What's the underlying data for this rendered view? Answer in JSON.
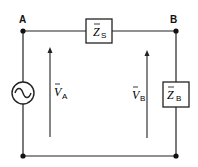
{
  "diagram": {
    "type": "circuit",
    "nodes": [
      {
        "id": "A",
        "label": "A"
      },
      {
        "id": "B",
        "label": "B"
      }
    ],
    "components": {
      "source": {
        "kind": "ac-voltage-source",
        "symbol": "~"
      },
      "series_impedance": {
        "symbol": "Z",
        "overline": true,
        "subscript": "S"
      },
      "load_impedance": {
        "symbol": "Z",
        "overline": true,
        "subscript": "B"
      }
    },
    "voltages": [
      {
        "symbol": "V",
        "overline": true,
        "subscript": "A"
      },
      {
        "symbol": "V",
        "overline": true,
        "subscript": "B"
      }
    ],
    "colors": {
      "line": "#222222",
      "background": "#ffffff"
    }
  }
}
